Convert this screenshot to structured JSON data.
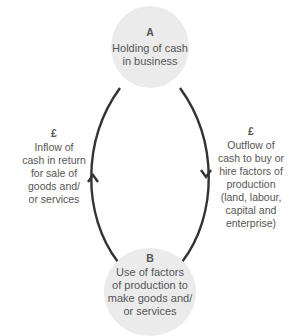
{
  "diagram": {
    "type": "circular-flow",
    "nodes": [
      {
        "id": "A",
        "letter": "A",
        "text": "Holding of cash in business",
        "lines": [
          "Holding of cash",
          "in business"
        ],
        "fill": "#ebebeb"
      },
      {
        "id": "B",
        "letter": "B",
        "text": "Use of factors of production to make goods and/ or services",
        "lines": [
          "Use of factors",
          "of production to",
          "make goods and/",
          "or services"
        ],
        "fill": "#ebebeb"
      }
    ],
    "edges": [
      {
        "from": "B",
        "to": "A",
        "side": "left",
        "direction": "up",
        "symbol": "£",
        "lines": [
          "Inflow of",
          "cash in return",
          "for sale of",
          "goods and/",
          "or services"
        ]
      },
      {
        "from": "A",
        "to": "B",
        "side": "right",
        "direction": "down",
        "symbol": "£",
        "lines": [
          "Outflow of",
          "cash to buy or",
          "hire factors of",
          "production",
          "(land, labour,",
          "capital and",
          "enterprise)"
        ]
      }
    ],
    "colors": {
      "arrow": "#333333",
      "text": "#555555",
      "node_fill": "#ebebeb"
    }
  }
}
